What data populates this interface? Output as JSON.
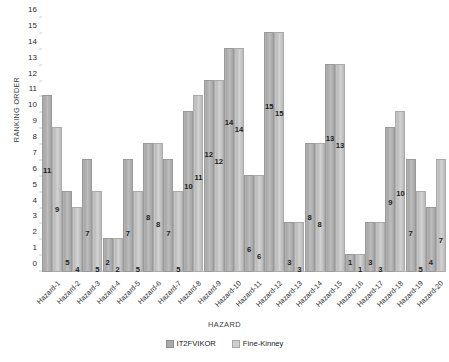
{
  "chart_data": {
    "type": "bar",
    "title": "",
    "xlabel": "HAZARD",
    "ylabel": "RANKING ORDER",
    "ylim": [
      0,
      16
    ],
    "yticks": [
      0,
      1,
      2,
      3,
      4,
      5,
      6,
      7,
      8,
      9,
      10,
      11,
      12,
      13,
      14,
      15,
      16
    ],
    "grid": false,
    "legend_position": "bottom",
    "categories": [
      "Hazard-1",
      "Hazard-2",
      "Hazard-3",
      "Hazard-4",
      "Hazard-5",
      "Hazard-6",
      "Hazard-7",
      "Hazard-8",
      "Hazard-9",
      "Hazard-10",
      "Hazard-11",
      "Hazard-12",
      "Hazard-13",
      "Hazard-14",
      "Hazard-15",
      "Hazard-16",
      "Hazard-17",
      "Hazard-18",
      "Hazard-19",
      "Hazard-20"
    ],
    "series": [
      {
        "name": "IT2FVIKOR",
        "color": "#ababab",
        "values": [
          11,
          5,
          7,
          2,
          7,
          8,
          7,
          10,
          12,
          14,
          6,
          15,
          3,
          8,
          13,
          1,
          3,
          9,
          7,
          4
        ]
      },
      {
        "name": "Fine-Kinney",
        "color": "#cfcfcf",
        "values": [
          9,
          4,
          5,
          2,
          5,
          8,
          5,
          11,
          12,
          14,
          6,
          15,
          3,
          8,
          13,
          1,
          3,
          10,
          5,
          7
        ]
      }
    ]
  },
  "legend": {
    "items": [
      {
        "label": "IT2FVIKOR"
      },
      {
        "label": "Fine-Kinney"
      }
    ]
  },
  "axes": {
    "x_title": "HAZARD",
    "y_title": "RANKING ORDER"
  }
}
